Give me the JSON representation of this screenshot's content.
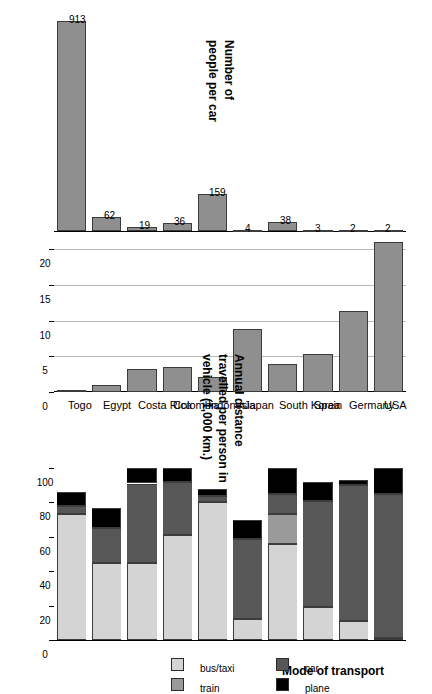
{
  "figure": {
    "orientation": "rotated-90",
    "countries": [
      "USA",
      "Germany",
      "Spain",
      "South Korea",
      "Japan",
      "Indonesia",
      "Colombia",
      "Costa Rica",
      "Egypt",
      "Togo"
    ]
  },
  "panel_transport": {
    "title": "Mode of transport",
    "axis_ticks": [
      "0",
      "20",
      "40",
      "60",
      "80",
      "100"
    ],
    "legend": [
      {
        "key": "bus_taxi",
        "label": "bus/taxi",
        "color": "#d4d4d4"
      },
      {
        "key": "train",
        "label": "train",
        "color": "#9a9a9a"
      },
      {
        "key": "car",
        "label": "car",
        "color": "#575757"
      },
      {
        "key": "plane",
        "label": "plane",
        "color": "#000000"
      }
    ]
  },
  "panel_distance": {
    "title_lines": [
      "Annual distance",
      "travelled per person in",
      "vehicle (1,000 km.)"
    ],
    "axis_ticks": [
      "0",
      "5",
      "10",
      "15",
      "20"
    ]
  },
  "panel_people": {
    "title_lines": [
      "Number of",
      "people per car"
    ]
  },
  "chart_data": [
    {
      "type": "bar",
      "id": "mode-of-transport",
      "title": "Mode of transport",
      "xlabel": "",
      "ylabel": "percent of travel",
      "ylim": [
        0,
        100
      ],
      "grid": false,
      "stacked": true,
      "legend_position": "right",
      "categories": [
        "USA",
        "Germany",
        "Spain",
        "South Korea",
        "Japan",
        "Indonesia",
        "Colombia",
        "Costa Rica",
        "Egypt",
        "Togo"
      ],
      "series": [
        {
          "name": "bus/taxi",
          "color": "#d4d4d4",
          "values": [
            1,
            11,
            19,
            56,
            12,
            80,
            61,
            45,
            45,
            73
          ]
        },
        {
          "name": "train",
          "color": "#9a9a9a",
          "values": [
            0,
            0,
            0,
            17,
            0,
            0,
            0,
            0,
            0,
            0
          ]
        },
        {
          "name": "car",
          "color": "#575757",
          "values": [
            84,
            79,
            62,
            12,
            47,
            4,
            31,
            46,
            20,
            5
          ]
        },
        {
          "name": "plane",
          "color": "#000000",
          "values": [
            15,
            3,
            11,
            15,
            11,
            4,
            8,
            9,
            12,
            8
          ]
        }
      ],
      "series_extra_note": "stack order from baseline: bus/taxi, train, car, plane; Germany and Indonesia show a thin train band just below plane"
    },
    {
      "type": "bar",
      "id": "annual-distance",
      "title": "Annual distance travelled per person in vehicle (1,000 km.)",
      "xlabel": "",
      "ylabel": "1,000 km",
      "ylim": [
        0,
        21
      ],
      "grid": true,
      "bar_color": "#8f8f8f",
      "categories": [
        "USA",
        "Germany",
        "Spain",
        "South Korea",
        "Japan",
        "Indonesia",
        "Colombia",
        "Costa Rica",
        "Egypt",
        "Togo"
      ],
      "values": [
        21.0,
        11.3,
        5.3,
        3.9,
        8.8,
        2.1,
        3.5,
        3.2,
        1.0,
        0.3
      ]
    },
    {
      "type": "bar",
      "id": "people-per-car",
      "title": "Number of people per car",
      "xlabel": "",
      "ylabel": "people per car",
      "ylim": [
        0,
        913
      ],
      "grid": false,
      "bar_color": "#8f8f8f",
      "categories": [
        "USA",
        "Germany",
        "Spain",
        "South Korea",
        "Japan",
        "Indonesia",
        "Colombia",
        "Costa Rica",
        "Egypt",
        "Togo"
      ],
      "values": [
        2,
        2,
        3,
        38,
        4,
        159,
        36,
        19,
        62,
        913
      ],
      "data_labels": [
        "2",
        "2",
        "3",
        "38",
        "4",
        "159",
        "36",
        "19",
        "62",
        "913"
      ]
    }
  ]
}
